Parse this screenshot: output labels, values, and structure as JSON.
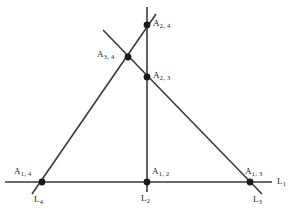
{
  "figure": {
    "width": 305,
    "height": 211,
    "background": "#ffffff",
    "stroke_color": "#3a3a3a",
    "point_color": "#1a1a1a",
    "label_color": "#1a1a1a"
  },
  "lines": [
    {
      "id": "L1",
      "name": "line-L1",
      "label": "L",
      "sub": "1",
      "orientation": "horizontal",
      "x1": 5,
      "y1": 182,
      "x2": 272,
      "y2": 182,
      "label_x": 277,
      "label_y": 177
    },
    {
      "id": "L2",
      "name": "line-L2",
      "label": "L",
      "sub": "2",
      "orientation": "vertical",
      "x1": 147,
      "y1": 7,
      "x2": 147,
      "y2": 192,
      "label_x": 141,
      "label_y": 194
    },
    {
      "id": "L3",
      "name": "line-L3",
      "label": "L",
      "sub": "3",
      "orientation": "diagonal-down-right",
      "x1": 103,
      "y1": 30,
      "x2": 262,
      "y2": 194,
      "label_x": 253,
      "label_y": 195
    },
    {
      "id": "L4",
      "name": "line-L4",
      "label": "L",
      "sub": "4",
      "orientation": "diagonal-up-right",
      "x1": 32,
      "y1": 194,
      "x2": 156,
      "y2": 14,
      "label_x": 34,
      "label_y": 195
    }
  ],
  "points": [
    {
      "id": "A24",
      "name": "intersection-point-A-2-4",
      "label": "A",
      "sub": "2, 4",
      "x": 147,
      "y": 25,
      "label_x": 153,
      "label_y": 19,
      "meets": [
        "L2",
        "L4"
      ]
    },
    {
      "id": "A34",
      "name": "intersection-point-A-3-4",
      "label": "A",
      "sub": "3, 4",
      "x": 128,
      "y": 57,
      "label_x": 97,
      "label_y": 50,
      "meets": [
        "L3",
        "L4"
      ]
    },
    {
      "id": "A23",
      "name": "intersection-point-A-2-3",
      "label": "A",
      "sub": "2, 3",
      "x": 147,
      "y": 77,
      "label_x": 153,
      "label_y": 71,
      "meets": [
        "L2",
        "L3"
      ]
    },
    {
      "id": "A14",
      "name": "intersection-point-A-1-4",
      "label": "A",
      "sub": "1, 4",
      "x": 42,
      "y": 182,
      "label_x": 14,
      "label_y": 167,
      "meets": [
        "L1",
        "L4"
      ]
    },
    {
      "id": "A12",
      "name": "intersection-point-A-1-2",
      "label": "A",
      "sub": "1, 2",
      "x": 147,
      "y": 182,
      "label_x": 152,
      "label_y": 167,
      "meets": [
        "L1",
        "L2"
      ]
    },
    {
      "id": "A13",
      "name": "intersection-point-A-1-3",
      "label": "A",
      "sub": "1, 3",
      "x": 250,
      "y": 182,
      "label_x": 245,
      "label_y": 167,
      "meets": [
        "L1",
        "L3"
      ]
    }
  ]
}
